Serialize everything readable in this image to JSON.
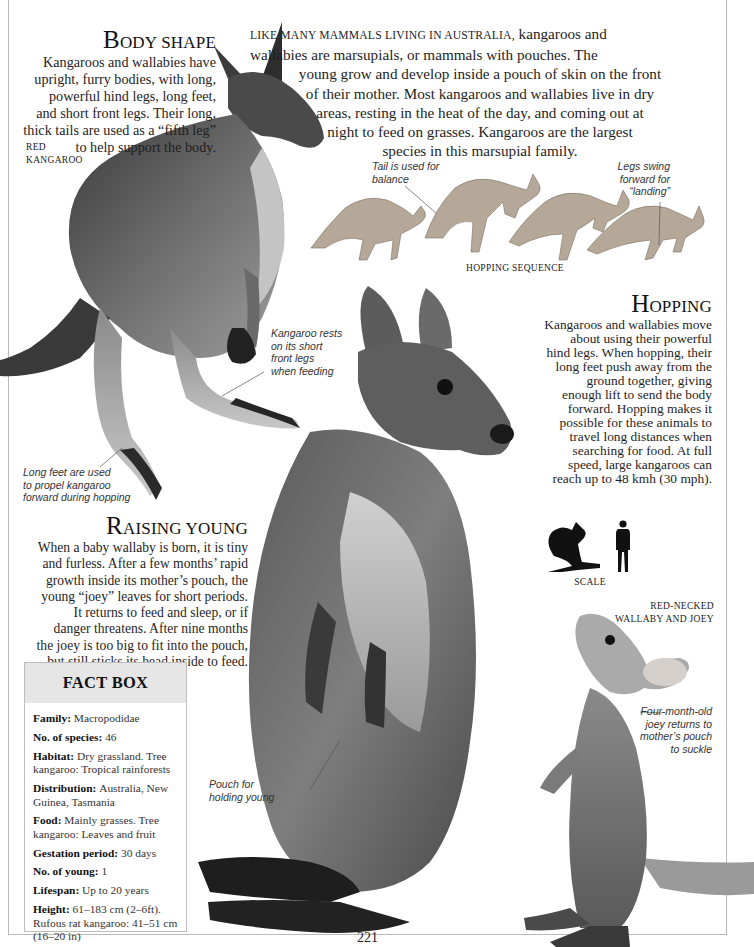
{
  "page": {
    "number": "221"
  },
  "intro": {
    "lead_smallcaps": "Like many mammals living in Australia,",
    "lines": [
      "kangaroos and",
      "wallabies are marsupials, or mammals with pouches. The",
      "young grow and develop inside a pouch of skin on the front",
      "of their mother. Most kangaroos and wallabies live in dry",
      "areas, resting in the heat of the day, and coming out at",
      "night to feed on grasses. Kangaroos are the largest",
      "species in this marsupial family."
    ]
  },
  "sections": {
    "body_shape": {
      "heading_cap": "B",
      "heading_rest": "ody shape",
      "lines": [
        "Kangaroos and wallabies have",
        "upright, furry bodies, with long,",
        "powerful hind legs, long feet,",
        "and short front legs. Their long,",
        "thick tails are used as a “fifth leg”",
        "to help support the body."
      ]
    },
    "hopping": {
      "heading_cap": "H",
      "heading_rest": "opping",
      "lines": [
        "Kangaroos and wallabies move",
        "about using their powerful",
        "hind legs. When hopping, their",
        "long feet push away from the",
        "ground together, giving",
        "enough lift to send the body",
        "forward. Hopping makes it",
        "possible for these animals to",
        "travel long distances when",
        "searching for food. At full",
        "speed, large kangaroos can",
        "reach up to 48 kmh (30 mph)."
      ]
    },
    "raising_young": {
      "heading_cap": "R",
      "heading_rest": "aising young",
      "lines": [
        "When a baby wallaby is born, it is tiny",
        "and furless. After a few months’ rapid",
        "growth inside its mother’s pouch, the",
        "young “joey” leaves for short periods.",
        "It returns to feed and sleep, or if",
        "danger threatens. After nine months",
        "the joey is too big to fit into the pouch,",
        "but still sticks its head inside to feed."
      ]
    }
  },
  "labels": {
    "red_kangaroo": [
      "Red",
      "Kangaroo"
    ],
    "hopping_sequence": "Hopping sequence",
    "scale": "Scale",
    "wallaby_and_joey": [
      "Red-necked",
      "Wallaby and joey"
    ]
  },
  "annotations": {
    "tail_balance": [
      "Tail is used for",
      "balance"
    ],
    "legs_swing": [
      "Legs swing",
      "forward for",
      "“landing”"
    ],
    "rests_front_legs": [
      "Kangaroo rests",
      "on its short",
      "front legs",
      "when feeding"
    ],
    "long_feet": [
      "Long feet are used",
      "to propel kangaroo",
      "forward during hopping"
    ],
    "pouch": [
      "Pouch for",
      "holding young"
    ],
    "joey_returns": [
      "Four-month-old",
      "joey returns to",
      "mother’s pouch",
      "to suckle"
    ]
  },
  "fact_box": {
    "title": "FACT BOX",
    "facts": [
      {
        "key": "Family:",
        "value": "Macropodidae"
      },
      {
        "key": "No. of species:",
        "value": "46"
      },
      {
        "key": "Habitat:",
        "value": "Dry grassland. Tree kangaroo: Tropical rainforests"
      },
      {
        "key": "Distribution:",
        "value": "Australia, New Guinea, Tasmania"
      },
      {
        "key": "Food:",
        "value": "Mainly grasses. Tree kangaroo: Leaves and fruit"
      },
      {
        "key": "Gestation period:",
        "value": "30 days"
      },
      {
        "key": "No. of young:",
        "value": "1"
      },
      {
        "key": "Lifespan:",
        "value": "Up to 20 years"
      },
      {
        "key": "Height:",
        "value": "61–183 cm (2–6ft). Rufous rat kangaroo: 41–51 cm (16–20 in)"
      }
    ]
  },
  "images": {
    "red_kangaroo": "red-kangaroo-photo",
    "hopping_sequence": "hopping-sequence-illustration",
    "wallaby": "red-necked-wallaby-photo",
    "joey": "joey-photo",
    "scale": "scale-silhouettes"
  }
}
